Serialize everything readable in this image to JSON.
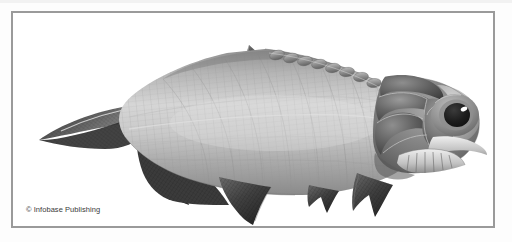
{
  "figure": {
    "orientation": "facing right",
    "style": "grayscale 3d rendered scientific illustration",
    "background_color": "#ffffff",
    "frame_color": "#9a9a9a",
    "page_background_color": "#fdfdfd"
  },
  "credit": {
    "text": "© Infobase Publishing"
  },
  "anatomy": {
    "parts": [
      {
        "name": "caudal-fin",
        "label": "Caudal fin (heterocercal, forked)"
      },
      {
        "name": "dorsal-fin",
        "label": "Dorsal fin"
      },
      {
        "name": "anal-fin",
        "label": "Anal fin"
      },
      {
        "name": "pelvic-fin",
        "label": "Pelvic fin"
      },
      {
        "name": "pectoral-fin",
        "label": "Pectoral fin"
      },
      {
        "name": "head-armor-plates",
        "label": "Bony head plates"
      },
      {
        "name": "eye",
        "label": "Eye"
      },
      {
        "name": "dorsal-scutes",
        "label": "Dorsal ridge scutes"
      },
      {
        "name": "body-scales",
        "label": "Ganoid scale grid"
      },
      {
        "name": "jaw",
        "label": "Lower jaw"
      }
    ]
  },
  "colors": {
    "body_light": "#d9d9d9",
    "body_mid": "#a8a8a8",
    "body_dark": "#6e6e6e",
    "fin_dark": "#4a4a4a",
    "fin_darkest": "#303030",
    "head_dark": "#5c5c5c",
    "eye_pupil": "#1c1c1c",
    "eye_highlight": "#ffffff",
    "scale_line": "#8c8c8c",
    "outline": "#5a5a5a"
  }
}
